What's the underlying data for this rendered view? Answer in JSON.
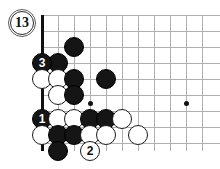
{
  "diagram": {
    "kind": "go-board-corner-diagram",
    "figure_label": "13",
    "board": {
      "origin_x": 42,
      "origin_y": 15,
      "spacing": 16,
      "cols": 11,
      "rows": 9,
      "left_edge_x": 42,
      "top_edge_y": 15,
      "bottom_edge_y": 151,
      "grid_color": "#b0b0b0",
      "edge_color": "#111111",
      "show_grid": true
    },
    "star_points": [
      {
        "x": 90,
        "y": 103
      },
      {
        "x": 186,
        "y": 103
      }
    ],
    "stones": [
      {
        "color": "black",
        "x": 74,
        "y": 47,
        "label": ""
      },
      {
        "color": "black",
        "x": 58,
        "y": 63,
        "label": ""
      },
      {
        "color": "black",
        "x": 42,
        "y": 63,
        "label": "3"
      },
      {
        "color": "white",
        "x": 42,
        "y": 79,
        "label": ""
      },
      {
        "color": "white",
        "x": 58,
        "y": 79,
        "label": ""
      },
      {
        "color": "black",
        "x": 74,
        "y": 79,
        "label": ""
      },
      {
        "color": "black",
        "x": 106,
        "y": 79,
        "label": ""
      },
      {
        "color": "white",
        "x": 58,
        "y": 95,
        "label": ""
      },
      {
        "color": "black",
        "x": 74,
        "y": 95,
        "label": ""
      },
      {
        "color": "black",
        "x": 42,
        "y": 119,
        "label": "1"
      },
      {
        "color": "white",
        "x": 58,
        "y": 119,
        "label": ""
      },
      {
        "color": "white",
        "x": 74,
        "y": 119,
        "label": ""
      },
      {
        "color": "black",
        "x": 90,
        "y": 119,
        "label": ""
      },
      {
        "color": "black",
        "x": 106,
        "y": 119,
        "label": ""
      },
      {
        "color": "white",
        "x": 122,
        "y": 119,
        "label": ""
      },
      {
        "color": "white",
        "x": 42,
        "y": 135,
        "label": ""
      },
      {
        "color": "black",
        "x": 58,
        "y": 135,
        "label": ""
      },
      {
        "color": "black",
        "x": 74,
        "y": 135,
        "label": ""
      },
      {
        "color": "white",
        "x": 90,
        "y": 135,
        "label": ""
      },
      {
        "color": "white",
        "x": 106,
        "y": 135,
        "label": ""
      },
      {
        "color": "white",
        "x": 138,
        "y": 135,
        "label": ""
      },
      {
        "color": "black",
        "x": 58,
        "y": 151,
        "label": ""
      },
      {
        "color": "white",
        "x": 90,
        "y": 151,
        "label": "2"
      }
    ]
  }
}
